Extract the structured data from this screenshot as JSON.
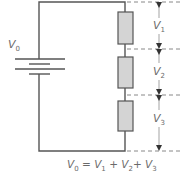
{
  "diagram": {
    "type": "series-circuit",
    "title": "",
    "colors": {
      "wire": "#555555",
      "resistor_fill": "#d4d4d4",
      "resistor_stroke": "#555555",
      "dashed": "#888888",
      "arrow": "#333333",
      "text": "#6a6a6a"
    },
    "source": {
      "label": "V",
      "subscript": "0",
      "symbol": "battery"
    },
    "resistors": [
      {
        "id": "R1",
        "voltage_label": "V",
        "subscript": "1"
      },
      {
        "id": "R2",
        "voltage_label": "V",
        "subscript": "2"
      },
      {
        "id": "R3",
        "voltage_label": "V",
        "subscript": "3"
      }
    ],
    "equation": {
      "lhs": "V",
      "lhs_sub": "0",
      "eq": " = ",
      "t1": "V",
      "t1_sub": "1",
      "plus1": " + ",
      "t2": "V",
      "t2_sub": "2",
      "plus2": "+ ",
      "t3": "V",
      "t3_sub": "3",
      "text": "V0 = V1 + V2+ V3"
    }
  }
}
